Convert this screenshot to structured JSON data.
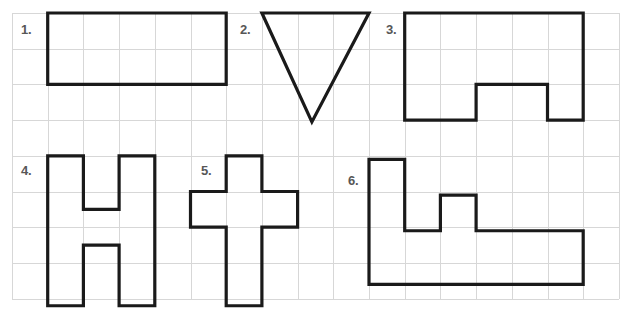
{
  "page": {
    "background_color": "#ffffff",
    "grid_line_color": "#d7d7d7",
    "shape_stroke_color": "#1a1a1a",
    "label_color": "#575757"
  },
  "grid": {
    "origin_x": 12,
    "origin_y": 13,
    "cell_size": 35.7,
    "columns": 17,
    "rows": 8,
    "visible": true
  },
  "shapes": [
    {
      "id": "shape-1",
      "label": "1.",
      "name": "rectangle",
      "label_x": 21,
      "label_y": 22,
      "grid_points": [
        [
          1,
          0
        ],
        [
          6,
          0
        ],
        [
          6,
          2
        ],
        [
          1,
          2
        ]
      ],
      "closed": true,
      "cells": 10,
      "perimeter_units": 14
    },
    {
      "id": "shape-2",
      "label": "2.",
      "name": "inverted-triangle",
      "label_x": 240,
      "label_y": 22,
      "grid_points": [
        [
          7,
          0
        ],
        [
          10,
          0
        ],
        [
          8.4,
          3.05
        ]
      ],
      "closed": true,
      "cells": 4.5,
      "perimeter_units": 9.8
    },
    {
      "id": "shape-3",
      "label": "3.",
      "name": "rectangle-with-bottom-notch",
      "label_x": 386,
      "label_y": 22,
      "grid_points": [
        [
          11,
          0
        ],
        [
          16,
          0
        ],
        [
          16,
          3
        ],
        [
          15,
          3
        ],
        [
          15,
          2
        ],
        [
          13,
          2
        ],
        [
          13,
          3
        ],
        [
          11,
          3
        ]
      ],
      "closed": true,
      "cells": 13,
      "perimeter_units": 18
    },
    {
      "id": "shape-4",
      "label": "4.",
      "name": "letter-h-shape",
      "label_x": 21,
      "label_y": 163,
      "grid_points": [
        [
          1,
          4
        ],
        [
          2,
          4
        ],
        [
          2,
          5.5
        ],
        [
          3,
          5.5
        ],
        [
          3,
          4
        ],
        [
          4,
          4
        ],
        [
          4,
          8.2
        ],
        [
          3,
          8.2
        ],
        [
          3,
          6.5
        ],
        [
          2,
          6.5
        ],
        [
          2,
          8.2
        ],
        [
          1,
          8.2
        ]
      ],
      "closed": true,
      "cells": 10.4,
      "perimeter_units": 22.4
    },
    {
      "id": "shape-5",
      "label": "5.",
      "name": "cross-shape",
      "label_x": 201,
      "label_y": 163,
      "grid_points": [
        [
          6,
          4
        ],
        [
          7,
          4
        ],
        [
          7,
          5
        ],
        [
          8,
          5
        ],
        [
          8,
          6
        ],
        [
          7,
          6
        ],
        [
          7,
          8.2
        ],
        [
          6,
          8.2
        ],
        [
          6,
          6
        ],
        [
          5,
          6
        ],
        [
          5,
          5
        ],
        [
          6,
          5
        ]
      ],
      "closed": true,
      "cells": 7.2,
      "perimeter_units": 18.4
    },
    {
      "id": "shape-6",
      "label": "6.",
      "name": "l-shape-with-bump",
      "label_x": 348,
      "label_y": 173,
      "grid_points": [
        [
          10,
          4.1
        ],
        [
          11,
          4.1
        ],
        [
          11,
          6.1
        ],
        [
          12,
          6.1
        ],
        [
          12,
          5.1
        ],
        [
          13,
          5.1
        ],
        [
          13,
          6.1
        ],
        [
          16,
          6.1
        ],
        [
          16,
          7.6
        ],
        [
          10,
          7.6
        ]
      ],
      "closed": true,
      "cells": 13,
      "perimeter_units": 20
    }
  ]
}
